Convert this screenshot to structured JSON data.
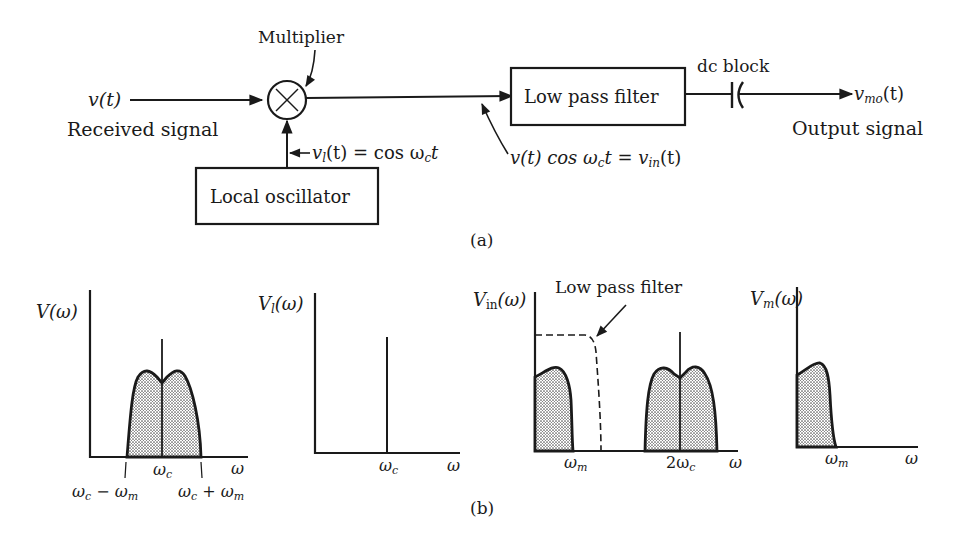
{
  "block_diagram": {
    "input_signal": "v(t)",
    "input_label": "Received signal",
    "multiplier_label": "Multiplier",
    "multiplier_symbol": "×",
    "oscillator_label": "Local oscillator",
    "oscillator_signal": "v",
    "oscillator_signal_sub": "l",
    "oscillator_signal_rest": "(t) = cos ω",
    "oscillator_signal_sub2": "c",
    "oscillator_signal_end": "t",
    "mixer_output_expr_a": "v(t) cos ω",
    "mixer_output_expr_sub": "c",
    "mixer_output_expr_b": "t = v",
    "mixer_output_expr_sub2": "in",
    "mixer_output_expr_c": "(t)",
    "filter_label": "Low pass filter",
    "dc_block_label": "dc block",
    "output_signal": "v",
    "output_signal_sub": "mo",
    "output_signal_end": "(t)",
    "output_label": "Output signal",
    "caption": "(a)"
  },
  "spectra": {
    "caption": "(b)",
    "plot1": {
      "ylabel": "V(ω)",
      "xlabel": "ω",
      "tick_center": "ω",
      "tick_center_sub": "c",
      "tick_low": "ω",
      "tick_low_sub": "c",
      "tick_low_rest": " − ω",
      "tick_low_sub2": "m",
      "tick_high": "ω",
      "tick_high_sub": "c",
      "tick_high_rest": " + ω",
      "tick_high_sub2": "m"
    },
    "plot2": {
      "ylabel": "V",
      "ylabel_sub": "l",
      "ylabel_rest": "(ω)",
      "xlabel": "ω",
      "tick": "ω",
      "tick_sub": "c"
    },
    "plot3": {
      "ylabel": "V",
      "ylabel_sub": "in",
      "ylabel_rest": "(ω)",
      "xlabel": "ω",
      "tick_m": "ω",
      "tick_m_sub": "m",
      "tick_2c": "2ω",
      "tick_2c_sub": "c",
      "filter_annotation": "Low pass filter"
    },
    "plot4": {
      "ylabel": "V",
      "ylabel_sub": "m",
      "ylabel_rest": "(ω)",
      "xlabel": "ω",
      "tick": "ω",
      "tick_sub": "m"
    }
  },
  "colors": {
    "ink": "#1a1a1a",
    "fill_stipple": "#bdbdbd",
    "background": "#ffffff"
  }
}
